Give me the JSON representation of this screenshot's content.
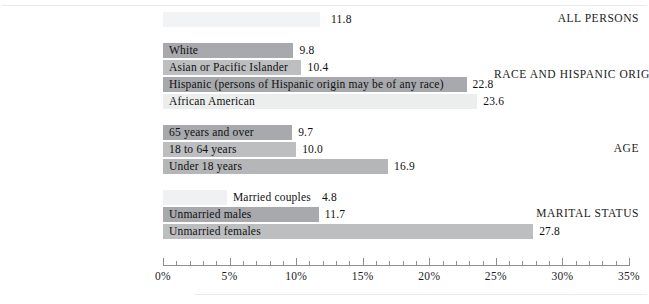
{
  "chart_data": {
    "type": "bar",
    "orientation": "horizontal",
    "title": "",
    "xlabel": "",
    "ylabel": "",
    "xlim": [
      0,
      35
    ],
    "xtick_labels": [
      "0%",
      "5%",
      "10%",
      "15%",
      "20%",
      "25%",
      "30%",
      "35%"
    ],
    "xtick_values": [
      0,
      5,
      10,
      15,
      20,
      25,
      30,
      35
    ],
    "minor_tick_step": 1,
    "grid": false,
    "legend": "none",
    "groups": [
      {
        "name": "ALL PERSONS",
        "bars": [
          {
            "label": "",
            "value": 11.8,
            "value_text": "11.8",
            "color": "#f2f3f4",
            "label_inside": false
          }
        ]
      },
      {
        "name": "RACE AND HISPANIC ORIGIN",
        "bars": [
          {
            "label": "White",
            "value": 9.8,
            "value_text": "9.8",
            "color": "#a7a9ac",
            "label_inside": true
          },
          {
            "label": "Asian or Pacific Islander",
            "value": 10.4,
            "value_text": "10.4",
            "color": "#bcbec0",
            "label_inside": true
          },
          {
            "label": "Hispanic (persons of Hispanic origin may be of any race)",
            "value": 22.8,
            "value_text": "22.8",
            "color": "#a7a9ac",
            "label_inside": true
          },
          {
            "label": "African American",
            "value": 23.6,
            "value_text": "23.6",
            "color": "#eceded",
            "label_inside": true
          }
        ]
      },
      {
        "name": "AGE",
        "bars": [
          {
            "label": "65 years and over",
            "value": 9.7,
            "value_text": "9.7",
            "color": "#a7a9ac",
            "label_inside": true
          },
          {
            "label": "18 to 64 years",
            "value": 10.0,
            "value_text": "10.0",
            "color": "#bcbec0",
            "label_inside": true
          },
          {
            "label": "Under 18 years",
            "value": 16.9,
            "value_text": "16.9",
            "color": "#b4b6b8",
            "label_inside": true
          }
        ]
      },
      {
        "name": "MARITAL STATUS",
        "bars": [
          {
            "label": "Married couples",
            "value": 4.8,
            "value_text": "4.8",
            "color": "#f0f1f2",
            "label_inside": false
          },
          {
            "label": "Unmarried males",
            "value": 11.7,
            "value_text": "11.7",
            "color": "#a7a9ac",
            "label_inside": true
          },
          {
            "label": "Unmarried females",
            "value": 27.8,
            "value_text": "27.8",
            "color": "#bcbec0",
            "label_inside": true
          }
        ]
      }
    ]
  }
}
